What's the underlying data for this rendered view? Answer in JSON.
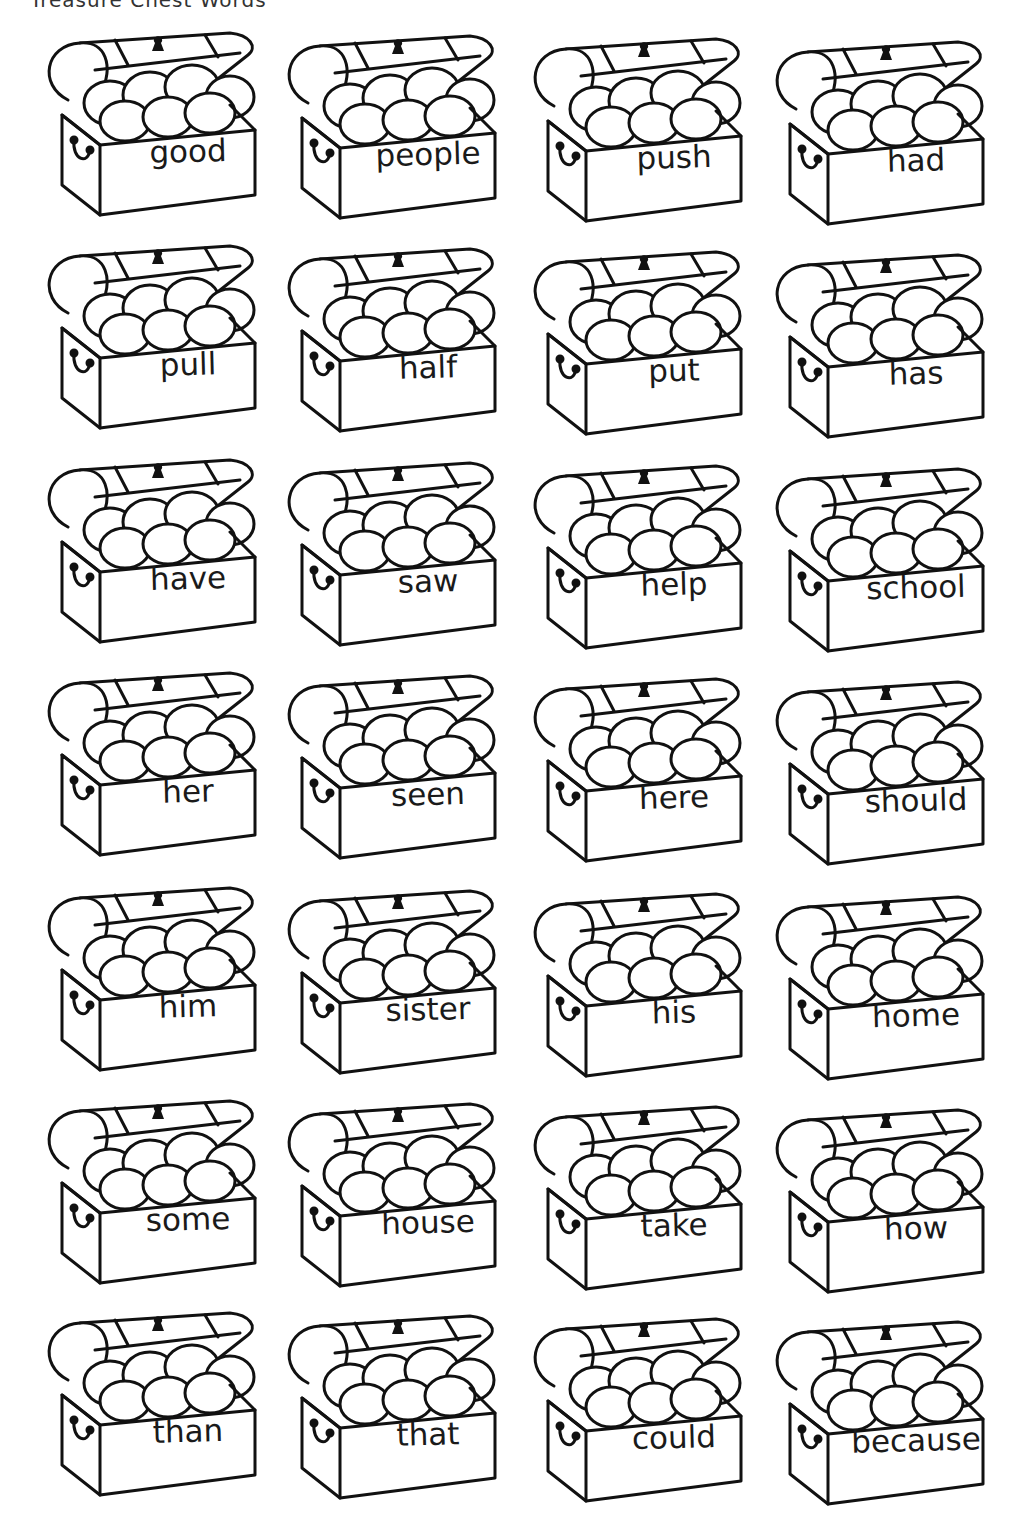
{
  "header": {
    "cut_off_text": "Treasure Chest Words"
  },
  "chests": [
    {
      "word": "good"
    },
    {
      "word": "people"
    },
    {
      "word": "push"
    },
    {
      "word": "had"
    },
    {
      "word": "pull"
    },
    {
      "word": "half"
    },
    {
      "word": "put"
    },
    {
      "word": "has"
    },
    {
      "word": "have"
    },
    {
      "word": "saw"
    },
    {
      "word": "help"
    },
    {
      "word": "school"
    },
    {
      "word": "her"
    },
    {
      "word": "seen"
    },
    {
      "word": "here"
    },
    {
      "word": "should"
    },
    {
      "word": "him"
    },
    {
      "word": "sister"
    },
    {
      "word": "his"
    },
    {
      "word": "home"
    },
    {
      "word": "some"
    },
    {
      "word": "house"
    },
    {
      "word": "take"
    },
    {
      "word": "how"
    },
    {
      "word": "than"
    },
    {
      "word": "that"
    },
    {
      "word": "could"
    },
    {
      "word": "because"
    }
  ],
  "layout": {
    "columns": 4,
    "rows": 7
  }
}
